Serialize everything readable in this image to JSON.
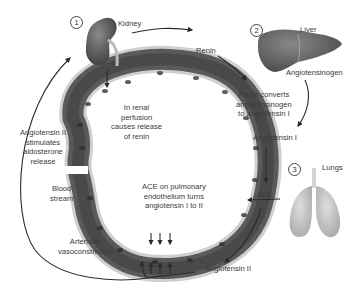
{
  "diagram": {
    "type": "renin-angiotensin-aldosterone system pathway",
    "colors": {
      "background": "#ffffff",
      "vessel_wall_outer": "#c9c9c9",
      "vessel_lumen": "#4a4a4a",
      "organ_dark": "#5b5b5b",
      "lungs": "#c7c7c7",
      "arrow": "#2a2a2a",
      "text": "#3a3a3a"
    },
    "organs": [
      {
        "step": "1",
        "name": "Kidney",
        "icon": "kidney-icon"
      },
      {
        "step": "2",
        "name": "Liver",
        "icon": "liver-icon"
      },
      {
        "step": "3",
        "name": "Lungs",
        "icon": "lungs-icon"
      }
    ],
    "labels": {
      "renin": "Renin",
      "angiotensinogen": "Angiotensinogen",
      "renin_converts": [
        "Renin converts",
        "angiotensinogen",
        "to angiotensin I"
      ],
      "angiotensin_1": "Angiotensin I",
      "ace": "ACE",
      "angiotensin_2": "Angiotensin II",
      "ace_pulmonary": [
        "ACE on pulmonary",
        "endothelium turns",
        "angiotensin I to II"
      ],
      "renal_perfusion": [
        "In renal",
        "perfusion",
        "causes release",
        "of renin"
      ],
      "aldosterone": [
        "Angiotensin II",
        "stimulates",
        "aldosterone",
        "release"
      ],
      "blood_stream": [
        "Blood",
        "stream"
      ],
      "vasoconstriction": [
        "Arteriolar",
        "vasoconstriction"
      ]
    }
  }
}
